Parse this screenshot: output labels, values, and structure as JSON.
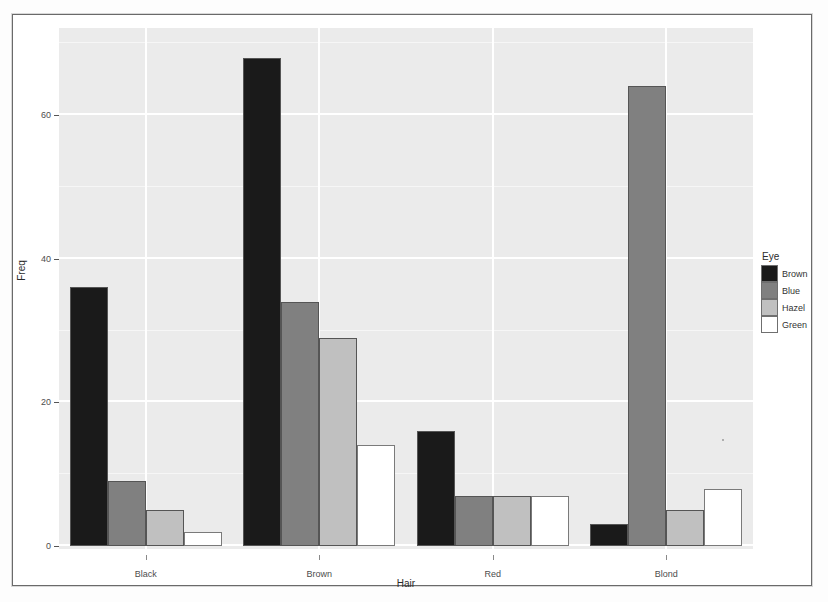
{
  "chart_data": {
    "type": "bar",
    "title": "",
    "subtitle": "",
    "xlabel": "Hair",
    "ylabel": "Freq",
    "categories": [
      "Black",
      "Brown",
      "Red",
      "Blond"
    ],
    "series": [
      {
        "name": "Brown",
        "color": "#1a1a1a",
        "values": [
          36,
          68,
          16,
          3
        ]
      },
      {
        "name": "Blue",
        "color": "#808080",
        "values": [
          9,
          34,
          7,
          64
        ]
      },
      {
        "name": "Hazel",
        "color": "#c0c0c0",
        "values": [
          5,
          29,
          7,
          5
        ]
      },
      {
        "name": "Green",
        "color": "#ffffff",
        "values": [
          2,
          14,
          7,
          8
        ]
      }
    ],
    "ylim": [
      0,
      72
    ],
    "yticks": [
      0,
      20,
      40,
      60
    ],
    "ytick_labels": [
      "0",
      "20",
      "40",
      "60"
    ],
    "grid": true,
    "grid_major_color": "#ffffff",
    "panel_background": "#ebebeb",
    "legend_position": "right",
    "legend_title": "Eye",
    "legend_entries": [
      "Brown",
      "Blue",
      "Hazel",
      "Green"
    ]
  },
  "legend": {
    "title": "Eye",
    "items": [
      {
        "label": "Brown",
        "color": "#1a1a1a"
      },
      {
        "label": "Blue",
        "color": "#808080"
      },
      {
        "label": "Hazel",
        "color": "#c0c0c0"
      },
      {
        "label": "Green",
        "color": "#ffffff"
      }
    ]
  },
  "axes": {
    "x_title": "Hair",
    "y_title": "Freq",
    "x_tick_labels": [
      "Black",
      "Brown",
      "Red",
      "Blond"
    ],
    "y_tick_labels": [
      "0",
      "20",
      "40",
      "60"
    ]
  }
}
